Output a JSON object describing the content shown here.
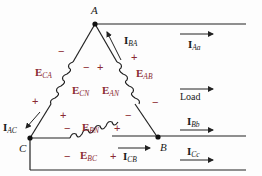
{
  "nodes": {
    "a": "A",
    "b": "B",
    "c": "C"
  },
  "voltages": {
    "eca": {
      "main": "E",
      "sub": "CA"
    },
    "ecn": {
      "main": "E",
      "sub": "CN"
    },
    "ean": {
      "main": "E",
      "sub": "AN"
    },
    "eab": {
      "main": "E",
      "sub": "AB"
    },
    "ebn": {
      "main": "E",
      "sub": "BN"
    },
    "ebc": {
      "main": "E",
      "sub": "BC"
    }
  },
  "currents": {
    "iba": {
      "main": "I",
      "sub": "BA"
    },
    "iaa": {
      "main": "I",
      "sub": "Aa"
    },
    "iac": {
      "main": "I",
      "sub": "AC"
    },
    "icb": {
      "main": "I",
      "sub": "CB"
    },
    "ibb": {
      "main": "I",
      "sub": "Bb"
    },
    "icc": {
      "main": "I",
      "sub": "Cc"
    }
  },
  "load_label": "Load",
  "signs": {
    "plus": "+",
    "minus": "−"
  },
  "colors": {
    "wire": "#222222",
    "label_red": "#8a2a32"
  }
}
